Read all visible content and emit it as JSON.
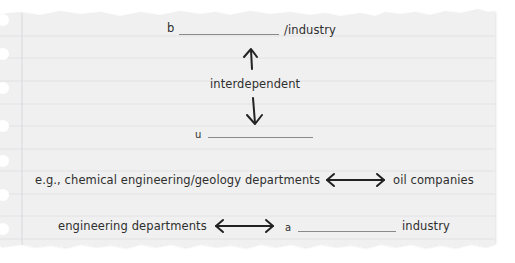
{
  "paper": {
    "background_color": "#f0f0f0",
    "rule_color": "#e2e2e6",
    "margin_color": "#d8d8dc",
    "ink_color": "#2e2e2e",
    "holes": 7
  },
  "diagram": {
    "top": {
      "prefix": "b",
      "suffix": "/industry"
    },
    "relation_label": "interdependent",
    "bottom": {
      "prefix": "u"
    },
    "example_row": {
      "left": "e.g., chemical engineering/geology departments",
      "right": "oil companies"
    },
    "second_row": {
      "left": "engineering departments",
      "prefix": "a",
      "suffix": "industry"
    }
  }
}
